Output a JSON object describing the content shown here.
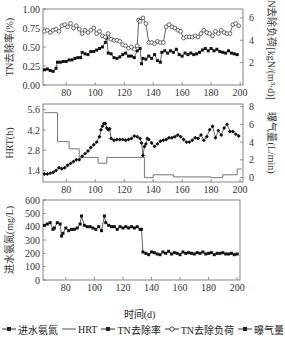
{
  "chart_data": [
    {
      "type": "scatter",
      "panel": "top",
      "title": "",
      "xlabel": "",
      "ylabel": "TN去除率(%)",
      "ylabel_right": "TN去除负荷[kgN/(m³·d)]",
      "xlim": [
        64,
        202
      ],
      "ylim": [
        0,
        1.0
      ],
      "ylim_right": [
        0,
        6.8
      ],
      "xticks": [
        80,
        100,
        120,
        140,
        160,
        180,
        200
      ],
      "yticks": [
        "0.00",
        "0.25",
        "0.50",
        "0.75",
        "1.00"
      ],
      "yticks_right": [
        "2",
        "4",
        "6"
      ],
      "grid": false,
      "series": [
        {
          "name": "TN去除率",
          "axis": "left",
          "marker": "filled-square",
          "x": [
            65,
            67,
            69,
            71,
            73,
            74,
            76,
            78,
            80,
            82,
            84,
            86,
            88,
            90,
            91,
            93,
            95,
            97,
            99,
            101,
            103,
            105,
            107,
            108,
            109,
            111,
            113,
            115,
            117,
            119,
            121,
            123,
            125,
            127,
            129,
            131,
            132,
            133,
            135,
            137,
            139,
            141,
            143,
            145,
            146,
            148,
            150,
            152,
            154,
            156,
            158,
            160,
            162,
            164,
            166,
            168,
            170,
            172,
            174,
            176,
            178,
            180,
            182,
            184,
            186,
            188,
            190,
            192,
            194,
            196,
            198
          ],
          "values": [
            0.2,
            0.21,
            0.19,
            0.18,
            0.22,
            0.3,
            0.3,
            0.31,
            0.31,
            0.33,
            0.33,
            0.35,
            0.36,
            0.36,
            0.43,
            0.41,
            0.4,
            0.44,
            0.44,
            0.46,
            0.48,
            0.5,
            0.56,
            0.62,
            0.42,
            0.41,
            0.36,
            0.35,
            0.37,
            0.4,
            0.42,
            0.38,
            0.38,
            0.36,
            0.45,
            0.48,
            0.28,
            0.35,
            0.34,
            0.38,
            0.35,
            0.4,
            0.32,
            0.3,
            0.43,
            0.45,
            0.42,
            0.45,
            0.43,
            0.47,
            0.4,
            0.38,
            0.42,
            0.4,
            0.42,
            0.4,
            0.41,
            0.43,
            0.46,
            0.48,
            0.45,
            0.48,
            0.45,
            0.47,
            0.44,
            0.43,
            0.42,
            0.45,
            0.42,
            0.41,
            0.4
          ]
        },
        {
          "name": "TN去除负荷",
          "axis": "right",
          "marker": "open-circle",
          "x": [
            65,
            67,
            69,
            71,
            73,
            75,
            77,
            79,
            81,
            83,
            85,
            87,
            89,
            91,
            93,
            95,
            97,
            99,
            101,
            103,
            105,
            107,
            109,
            111,
            113,
            115,
            117,
            119,
            121,
            123,
            125,
            127,
            129,
            130,
            131,
            133,
            135,
            137,
            139,
            141,
            143,
            145,
            147,
            149,
            151,
            153,
            155,
            157,
            159,
            161,
            163,
            165,
            167,
            169,
            171,
            173,
            175,
            177,
            179,
            181,
            183,
            185,
            187,
            189,
            191,
            193,
            195,
            197,
            199
          ],
          "values": [
            4.8,
            4.9,
            4.7,
            4.9,
            5.0,
            4.8,
            5.3,
            5.4,
            5.2,
            5.5,
            5.1,
            5.3,
            5.0,
            4.6,
            4.9,
            4.7,
            4.9,
            5.1,
            4.6,
            4.8,
            4.4,
            4.3,
            4.6,
            4.1,
            4.0,
            4.0,
            3.9,
            3.6,
            3.5,
            3.3,
            3.4,
            3.2,
            3.5,
            5.8,
            5.7,
            6.0,
            5.5,
            3.8,
            3.8,
            3.7,
            3.9,
            3.8,
            3.8,
            5.2,
            5.4,
            5.2,
            5.1,
            4.9,
            4.8,
            4.2,
            4.3,
            4.3,
            4.3,
            4.4,
            4.3,
            4.6,
            4.9,
            4.7,
            4.6,
            4.4,
            4.8,
            4.6,
            4.9,
            4.7,
            4.6,
            4.6,
            5.4,
            5.5,
            5.3
          ]
        }
      ]
    },
    {
      "type": "line",
      "panel": "middle",
      "ylabel": "HRT(h)",
      "ylabel_right": "曝气量(L/min)",
      "xlim": [
        64,
        202
      ],
      "ylim": [
        0.6,
        6.0
      ],
      "ylim_right": [
        -0.5,
        8.3
      ],
      "xticks": [
        80,
        100,
        120,
        140,
        160,
        180,
        200
      ],
      "yticks": [
        "1.4",
        "2.8",
        "4.2",
        "5.6"
      ],
      "yticks_right": [
        "0",
        "2",
        "4",
        "6",
        "8"
      ],
      "series": [
        {
          "name": "HRT",
          "axis": "left",
          "style": "step",
          "x": [
            65,
            74,
            74,
            82,
            82,
            89,
            89,
            102,
            102,
            108,
            108,
            134,
            134,
            140,
            140,
            154,
            154,
            180,
            180,
            188,
            188,
            198,
            198,
            201
          ],
          "values": [
            5.4,
            5.4,
            3.4,
            3.4,
            2.9,
            2.9,
            2.3,
            2.3,
            1.9,
            1.9,
            2.3,
            2.3,
            0.9,
            0.9,
            1.1,
            1.1,
            0.95,
            0.95,
            0.9,
            0.9,
            1.1,
            1.1,
            1.5,
            1.5
          ]
        },
        {
          "name": "曝气量",
          "axis": "right",
          "marker": "filled-diamond",
          "x": [
            65,
            67,
            69,
            71,
            73,
            75,
            77,
            79,
            81,
            83,
            85,
            87,
            89,
            91,
            93,
            95,
            97,
            99,
            101,
            103,
            104,
            105,
            106,
            107,
            108,
            109,
            110,
            111,
            113,
            115,
            117,
            119,
            121,
            123,
            125,
            127,
            129,
            131,
            132,
            133,
            134,
            135,
            136,
            137,
            139,
            141,
            143,
            145,
            147,
            149,
            151,
            153,
            155,
            157,
            159,
            161,
            163,
            165,
            167,
            169,
            171,
            173,
            175,
            177,
            179,
            181,
            183,
            185,
            187,
            189,
            191,
            193,
            195,
            197,
            199
          ],
          "values": [
            0.4,
            0.4,
            0.5,
            0.6,
            0.8,
            1.1,
            1.0,
            1.1,
            1.4,
            1.6,
            1.8,
            2.0,
            2.0,
            2.4,
            2.7,
            3.0,
            3.4,
            3.7,
            4.0,
            4.6,
            5.4,
            5.8,
            6.1,
            6.1,
            5.6,
            5.4,
            5.5,
            4.4,
            4.2,
            4.3,
            4.3,
            4.3,
            4.2,
            4.3,
            4.4,
            4.7,
            4.6,
            4.4,
            3.9,
            2.5,
            3.5,
            3.8,
            4.4,
            4.3,
            3.9,
            3.5,
            3.8,
            4.1,
            4.2,
            4.3,
            4.5,
            4.5,
            4.6,
            4.8,
            4.6,
            4.3,
            4.0,
            4.0,
            4.2,
            4.5,
            4.4,
            4.8,
            4.2,
            4.6,
            5.4,
            5.8,
            4.5,
            5.3,
            4.8,
            5.6,
            6.0,
            5.2,
            5.2,
            4.9,
            4.7
          ]
        }
      ]
    },
    {
      "type": "scatter",
      "panel": "bottom",
      "ylabel": "进水氨氮(mg/L)",
      "xlabel": "时间(d)",
      "xlim": [
        64,
        202
      ],
      "ylim": [
        0,
        600
      ],
      "xticks": [
        80,
        100,
        120,
        140,
        160,
        180,
        200
      ],
      "yticks": [
        "0",
        "100",
        "200",
        "300",
        "400",
        "500",
        "600"
      ],
      "series": [
        {
          "name": "进水氨氮",
          "marker": "filled-square",
          "x": [
            65,
            67,
            69,
            71,
            72,
            74,
            76,
            77,
            78,
            80,
            82,
            84,
            86,
            88,
            90,
            91,
            93,
            95,
            97,
            99,
            101,
            103,
            105,
            107,
            108,
            110,
            112,
            114,
            116,
            118,
            120,
            122,
            124,
            126,
            128,
            130,
            132,
            133,
            134,
            136,
            138,
            140,
            142,
            144,
            146,
            148,
            150,
            152,
            154,
            156,
            158,
            160,
            162,
            164,
            166,
            168,
            170,
            172,
            174,
            176,
            178,
            180,
            182,
            184,
            186,
            188,
            190,
            192,
            194,
            196,
            198,
            200
          ],
          "values": [
            410,
            420,
            430,
            380,
            390,
            430,
            420,
            330,
            350,
            390,
            370,
            380,
            380,
            390,
            420,
            480,
            410,
            400,
            400,
            390,
            380,
            400,
            370,
            480,
            430,
            410,
            400,
            400,
            380,
            400,
            390,
            400,
            390,
            400,
            390,
            400,
            380,
            380,
            210,
            200,
            190,
            210,
            205,
            195,
            190,
            210,
            200,
            215,
            195,
            205,
            200,
            190,
            210,
            200,
            205,
            200,
            195,
            205,
            200,
            210,
            195,
            200,
            205,
            190,
            200,
            200,
            205,
            195,
            195,
            200,
            190,
            195
          ]
        }
      ]
    }
  ],
  "axes": {
    "top": {
      "ylabel": "TN去除率(%)",
      "ylabel_right": "TN去除负荷[kgN/(m³·d)]"
    },
    "middle": {
      "ylabel": "HRT(h)",
      "ylabel_right": "曝气量(L/min)"
    },
    "bottom": {
      "ylabel": "进水氨氮(mg/L)"
    },
    "xlabel": "时间(d)"
  },
  "legend": [
    {
      "label": "进水氨氮",
      "symbol": "line-filled-dot"
    },
    {
      "label": "HRT",
      "symbol": "line"
    },
    {
      "label": "TN去除率",
      "symbol": "line-filled-dot"
    },
    {
      "label": "TN去除负荷",
      "symbol": "line-open-circle"
    },
    {
      "label": "曝气量",
      "symbol": "line-filled-dot"
    }
  ]
}
